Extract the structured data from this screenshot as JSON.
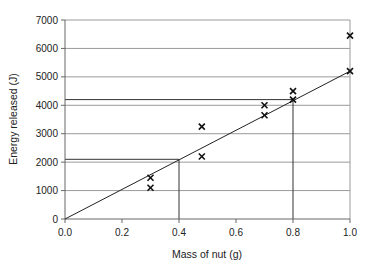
{
  "chart_data": {
    "type": "scatter",
    "title": "",
    "xlabel": "Mass of nut (g)",
    "ylabel": "Energy released (J)",
    "xlim": [
      0,
      1.0
    ],
    "ylim": [
      0,
      7000
    ],
    "x_ticks": [
      "0.0",
      "0.2",
      "0.4",
      "0.6",
      "0.8",
      "1.0"
    ],
    "y_ticks": [
      "0",
      "1000",
      "2000",
      "3000",
      "4000",
      "5000",
      "6000",
      "7000"
    ],
    "grid": {
      "horizontal": true,
      "vertical": false
    },
    "marker": "x",
    "series": [
      {
        "name": "Measurements",
        "points": [
          {
            "x": 0.3,
            "y": 1100
          },
          {
            "x": 0.3,
            "y": 1450
          },
          {
            "x": 0.48,
            "y": 2200
          },
          {
            "x": 0.48,
            "y": 3250
          },
          {
            "x": 0.7,
            "y": 3650
          },
          {
            "x": 0.7,
            "y": 4000
          },
          {
            "x": 0.8,
            "y": 4200
          },
          {
            "x": 0.8,
            "y": 4500
          },
          {
            "x": 1.0,
            "y": 5200
          },
          {
            "x": 1.0,
            "y": 6450
          }
        ]
      }
    ],
    "best_fit_line": {
      "x1": 0,
      "y1": 0,
      "x2": 1.0,
      "y2": 5200
    },
    "reading_guides": [
      {
        "x": 0.4,
        "y": 2100
      },
      {
        "x": 0.8,
        "y": 4200
      }
    ],
    "legend": null
  }
}
